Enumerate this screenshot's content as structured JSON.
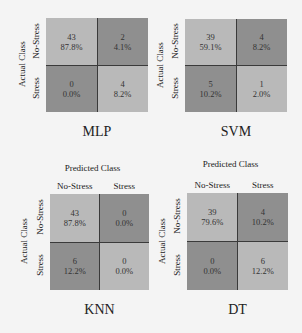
{
  "chart_data": [
    {
      "type": "heatmap",
      "title": "MLP",
      "xlabel": "",
      "ylabel": "Actual Class",
      "row_labels": [
        "No-Stress",
        "Stress"
      ],
      "col_labels": [],
      "counts": [
        [
          43,
          2
        ],
        [
          0,
          4
        ]
      ],
      "percents": [
        [
          "87.8%",
          "4.1%"
        ],
        [
          "0.0%",
          "8.2%"
        ]
      ]
    },
    {
      "type": "heatmap",
      "title": "SVM",
      "xlabel": "",
      "ylabel": "Actual Class",
      "row_labels": [
        "No-Stress",
        "Stress"
      ],
      "col_labels": [],
      "counts": [
        [
          39,
          4
        ],
        [
          5,
          1
        ]
      ],
      "percents": [
        [
          "59.1%",
          "8.2%"
        ],
        [
          "10.2%",
          "2.0%"
        ]
      ]
    },
    {
      "type": "heatmap",
      "title": "KNN",
      "xlabel": "Predicted Class",
      "ylabel": "Actual Class",
      "row_labels": [
        "No-Stress",
        "Stress"
      ],
      "col_labels": [
        "No-Stress",
        "Stress"
      ],
      "counts": [
        [
          43,
          0
        ],
        [
          6,
          0
        ]
      ],
      "percents": [
        [
          "87.8%",
          "0.0%"
        ],
        [
          "12.2%",
          "0.0%"
        ]
      ]
    },
    {
      "type": "heatmap",
      "title": "DT",
      "xlabel": "Predicted Class",
      "ylabel": "Actual Class",
      "row_labels": [
        "No-Stress",
        "Stress"
      ],
      "col_labels": [
        "No-Stress",
        "Stress"
      ],
      "counts": [
        [
          39,
          4
        ],
        [
          0,
          6
        ]
      ],
      "percents": [
        [
          "79.6%",
          "10.2%"
        ],
        [
          "0.0%",
          "12.2%"
        ]
      ]
    }
  ],
  "colors": {
    "diagonal": "#b9b9b9",
    "off_diagonal": "#8f8f8f",
    "border": "#3a3a3a"
  }
}
